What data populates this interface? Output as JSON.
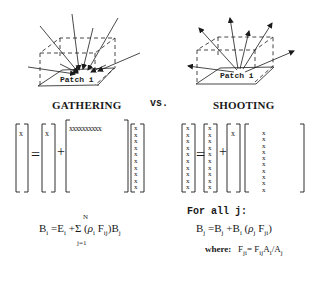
{
  "gathering": {
    "title": "GATHERING",
    "patch_label": "Patch i",
    "matrix": {
      "lhs": "x",
      "rhs_vector": "x",
      "row": "xxxxxxxxxx",
      "column": "xxxxxxxxxx",
      "equals": "=",
      "plus": "+"
    },
    "formula": {
      "lhs": "B",
      "lhs_sub": "i",
      "eq": "=",
      "e": "E",
      "e_sub": "i",
      "plus": "+",
      "sum": "Σ",
      "sum_upper": "N",
      "sum_lower": "j=1",
      "paren_open": "(",
      "rho": "ρ",
      "rho_sub": "i",
      "f": "F",
      "f_sub": "ij",
      "paren_close": ")",
      "b": "B",
      "b_sub": "j"
    }
  },
  "versus": "vs.",
  "shooting": {
    "title": "SHOOTING",
    "patch_label": "Patch i",
    "matrix": {
      "lhs_column": "xxxxxxxxxx",
      "rhs_column": "xxxxxxxxxx",
      "scalar": "x",
      "column": "xxxxxxxxxx",
      "equals": "=",
      "plus": "+"
    },
    "formula": {
      "intro": "For all j:",
      "lhs": "B",
      "lhs_sub": "j",
      "eq": "=",
      "b1": "B",
      "b1_sub": "j",
      "plus": "+",
      "b2": "B",
      "b2_sub": "i",
      "paren_open": "(",
      "rho": "ρ",
      "rho_sub": "j",
      "f": "F",
      "f_sub": "ji",
      "paren_close": ")",
      "where_label": "where:",
      "where_f": "F",
      "where_f_sub": "ji",
      "where_eq": "=",
      "where_rhs_f": "F",
      "where_rhs_f_sub": "ij",
      "where_a1": "A",
      "where_a1_sub": "i",
      "where_div": "/",
      "where_a2": "A",
      "where_a2_sub": "j"
    }
  }
}
